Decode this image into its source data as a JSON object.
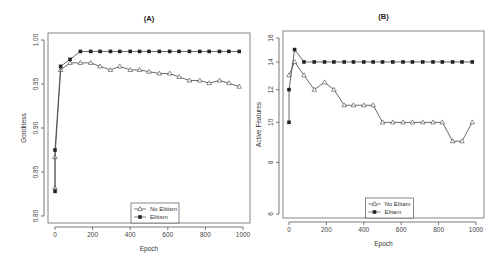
{
  "figure": {
    "width": 503,
    "height": 264,
    "line_color": "#444444",
    "background": "#ffffff"
  },
  "chart_data": [
    {
      "id": "A",
      "type": "line",
      "title": "(A)",
      "xlabel": "Epoch",
      "ylabel": "Goodness",
      "xlim": [
        0,
        1000
      ],
      "ylim": [
        0.8,
        1.0
      ],
      "yscale": "linear",
      "xticks": [
        0,
        200,
        400,
        600,
        800,
        1000
      ],
      "yticks": [
        0.8,
        0.85,
        0.9,
        0.95,
        1.0
      ],
      "ytick_labels": [
        "0.80",
        "0.85",
        "0.90",
        "0.95",
        "1.00"
      ],
      "grid": false,
      "legend_position": "bottom-center",
      "legend": [
        "No Elitism",
        "Elitism"
      ],
      "series": [
        {
          "name": "No Elitism",
          "marker": "open-triangle",
          "x": [
            0,
            0,
            30,
            80,
            135,
            190,
            240,
            295,
            345,
            400,
            450,
            500,
            555,
            610,
            660,
            715,
            770,
            820,
            875,
            925,
            980
          ],
          "values": [
            0.832,
            0.867,
            0.966,
            0.974,
            0.974,
            0.974,
            0.97,
            0.966,
            0.97,
            0.966,
            0.966,
            0.964,
            0.962,
            0.962,
            0.958,
            0.954,
            0.954,
            0.951,
            0.954,
            0.951,
            0.947
          ]
        },
        {
          "name": "Elitism",
          "marker": "filled-square",
          "x": [
            0,
            0,
            30,
            80,
            135,
            190,
            240,
            295,
            345,
            400,
            450,
            500,
            555,
            610,
            660,
            715,
            770,
            820,
            875,
            925,
            980
          ],
          "values": [
            0.828,
            0.875,
            0.97,
            0.978,
            0.987,
            0.987,
            0.987,
            0.987,
            0.987,
            0.987,
            0.987,
            0.987,
            0.987,
            0.987,
            0.987,
            0.987,
            0.987,
            0.987,
            0.987,
            0.987,
            0.987
          ]
        }
      ],
      "layout": {
        "left": 48,
        "top": 33,
        "right": 250,
        "bottom": 223,
        "x0px": 55,
        "x1px": 243,
        "y0px": 216,
        "y1px": 40
      }
    },
    {
      "id": "B",
      "type": "line",
      "title": "(B)",
      "xlabel": "Epoch",
      "ylabel": "Active Features",
      "xlim": [
        0,
        1000
      ],
      "ylim": [
        6,
        16
      ],
      "yscale": "log",
      "xticks": [
        0,
        200,
        400,
        600,
        800,
        1000
      ],
      "yticks": [
        6,
        8,
        10,
        12,
        14,
        16
      ],
      "ytick_labels": [
        "6",
        "8",
        "10",
        "12",
        "14",
        "16"
      ],
      "grid": false,
      "legend_position": "bottom-center",
      "legend": [
        "No Elitam",
        "Elitam"
      ],
      "series": [
        {
          "name": "No Elitam",
          "marker": "open-triangle",
          "x": [
            0,
            30,
            80,
            135,
            190,
            240,
            295,
            345,
            400,
            450,
            500,
            555,
            610,
            660,
            715,
            770,
            820,
            875,
            925,
            980
          ],
          "values": [
            13,
            14,
            13,
            12,
            12.5,
            12,
            11,
            11,
            11,
            11,
            10,
            10,
            10,
            10,
            10,
            10,
            10,
            9,
            9,
            10
          ]
        },
        {
          "name": "Elitam",
          "marker": "filled-square",
          "x": [
            0,
            0,
            30,
            80,
            135,
            190,
            240,
            295,
            345,
            400,
            450,
            500,
            555,
            610,
            660,
            715,
            770,
            820,
            875,
            925,
            980
          ],
          "values": [
            10,
            12,
            15,
            14,
            14,
            14,
            14,
            14,
            14,
            14,
            14,
            14,
            14,
            14,
            14,
            14,
            14,
            14,
            14,
            14,
            14
          ]
        }
      ],
      "layout": {
        "left": 283,
        "top": 31,
        "right": 484,
        "bottom": 218,
        "x0px": 289,
        "x1px": 476,
        "y0px": 214,
        "y1px": 38
      }
    }
  ]
}
